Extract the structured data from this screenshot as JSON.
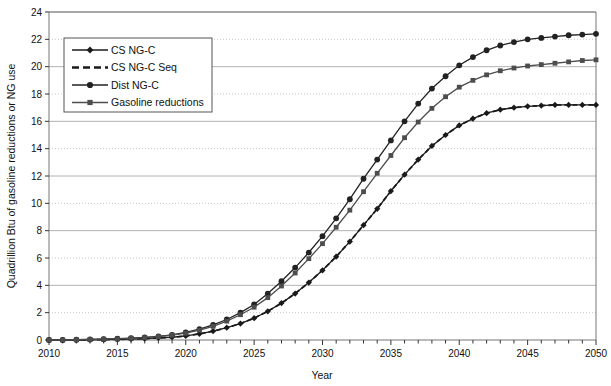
{
  "chart_data": {
    "type": "line",
    "title": "",
    "xlabel": "Year",
    "ylabel": "Quadrillion Btu of gasoline reductions or NG use",
    "xlim": [
      2010,
      2050
    ],
    "ylim": [
      0,
      24
    ],
    "ytick_step": 2,
    "xtick_label_step": 5,
    "xtick_minor_step": 1,
    "grid": "horizontal-alternating-solid-dotted",
    "legend_position": "upper-left-inside",
    "yticks": [
      0,
      2,
      4,
      6,
      8,
      10,
      12,
      14,
      16,
      18,
      20,
      22,
      24
    ],
    "xticks": [
      2010,
      2015,
      2020,
      2025,
      2030,
      2035,
      2040,
      2045,
      2050
    ],
    "x": [
      2010,
      2011,
      2012,
      2013,
      2014,
      2015,
      2016,
      2017,
      2018,
      2019,
      2020,
      2021,
      2022,
      2023,
      2024,
      2025,
      2026,
      2027,
      2028,
      2029,
      2030,
      2031,
      2032,
      2033,
      2034,
      2035,
      2036,
      2037,
      2038,
      2039,
      2040,
      2041,
      2042,
      2043,
      2044,
      2045,
      2046,
      2047,
      2048,
      2049,
      2050
    ],
    "series": [
      {
        "name": "CS NG-C",
        "marker": "diamond",
        "dash": "solid",
        "color": "#1a1a1a",
        "values": [
          0.0,
          0.0,
          0.0,
          0.02,
          0.03,
          0.05,
          0.07,
          0.1,
          0.15,
          0.2,
          0.3,
          0.45,
          0.65,
          0.9,
          1.2,
          1.6,
          2.1,
          2.7,
          3.4,
          4.2,
          5.1,
          6.1,
          7.2,
          8.4,
          9.6,
          10.9,
          12.1,
          13.2,
          14.2,
          15.0,
          15.7,
          16.2,
          16.6,
          16.85,
          17.0,
          17.1,
          17.15,
          17.2,
          17.2,
          17.2,
          17.2
        ]
      },
      {
        "name": "CS NG-C Seq",
        "marker": "none",
        "dash": "dashed",
        "color": "#1a1a1a",
        "values": [
          0.0,
          0.0,
          0.0,
          0.02,
          0.03,
          0.05,
          0.07,
          0.1,
          0.15,
          0.2,
          0.3,
          0.45,
          0.65,
          0.9,
          1.2,
          1.6,
          2.1,
          2.7,
          3.4,
          4.2,
          5.1,
          6.1,
          7.2,
          8.4,
          9.6,
          10.9,
          12.1,
          13.2,
          14.2,
          15.0,
          15.7,
          16.2,
          16.6,
          16.85,
          17.0,
          17.1,
          17.15,
          17.2,
          17.2,
          17.2,
          17.2
        ]
      },
      {
        "name": "Dist NG-C",
        "marker": "circle",
        "dash": "solid",
        "color": "#222222",
        "values": [
          0.0,
          0.0,
          0.02,
          0.04,
          0.06,
          0.09,
          0.13,
          0.19,
          0.27,
          0.38,
          0.55,
          0.8,
          1.1,
          1.5,
          2.0,
          2.6,
          3.4,
          4.3,
          5.3,
          6.4,
          7.6,
          8.9,
          10.3,
          11.8,
          13.2,
          14.6,
          16.0,
          17.3,
          18.4,
          19.3,
          20.1,
          20.7,
          21.2,
          21.55,
          21.8,
          22.0,
          22.1,
          22.2,
          22.3,
          22.35,
          22.4
        ]
      },
      {
        "name": "Gasoline reductions",
        "marker": "square",
        "dash": "solid",
        "color": "#4d4d4d",
        "values": [
          0.0,
          0.0,
          0.02,
          0.04,
          0.06,
          0.08,
          0.12,
          0.17,
          0.25,
          0.35,
          0.5,
          0.72,
          1.0,
          1.38,
          1.85,
          2.4,
          3.1,
          3.95,
          4.9,
          5.95,
          7.05,
          8.25,
          9.5,
          10.85,
          12.2,
          13.5,
          14.8,
          15.95,
          16.95,
          17.8,
          18.5,
          19.0,
          19.4,
          19.7,
          19.9,
          20.05,
          20.15,
          20.25,
          20.35,
          20.45,
          20.5
        ]
      }
    ]
  },
  "legend": {
    "items": [
      {
        "label": "CS NG-C"
      },
      {
        "label": "CS NG-C Seq"
      },
      {
        "label": "Dist NG-C"
      },
      {
        "label": "Gasoline reductions"
      }
    ]
  }
}
